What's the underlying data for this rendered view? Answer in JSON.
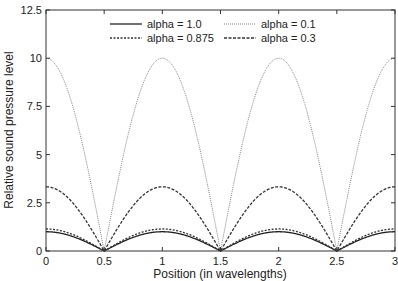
{
  "chart_data": {
    "type": "line",
    "title": "",
    "xlabel": "Position (in wavelengths)",
    "ylabel": "Relative sound pressure level",
    "xlim": [
      0,
      3
    ],
    "ylim": [
      0,
      12.5
    ],
    "xticks": [
      "0",
      "0.5",
      "1",
      "1.5",
      "2",
      "2.5",
      "3"
    ],
    "yticks": [
      "0",
      "2.5",
      "5",
      "7.5",
      "10",
      "12.5"
    ],
    "grid": false,
    "legend_position": "upper center",
    "x": [
      0,
      0.25,
      0.5,
      0.75,
      1,
      1.25,
      1.5,
      1.75,
      2,
      2.25,
      2.5,
      2.75,
      3
    ],
    "series": [
      {
        "name": "alpha = 1.0",
        "style": "solid",
        "values": [
          1.0,
          0.707,
          0,
          0.707,
          1.0,
          0.707,
          0,
          0.707,
          1.0,
          0.707,
          0,
          0.707,
          1.0
        ]
      },
      {
        "name": "alpha = 0.875",
        "style": "dotted",
        "values": [
          1.143,
          0.808,
          0,
          0.808,
          1.143,
          0.808,
          0,
          0.808,
          1.143,
          0.808,
          0,
          0.808,
          1.143
        ]
      },
      {
        "name": "alpha = 0.1",
        "style": "fine-dotted",
        "values": [
          10.0,
          7.07,
          0,
          7.07,
          10.0,
          7.07,
          0,
          7.07,
          10.0,
          7.07,
          0,
          7.07,
          10.0
        ]
      },
      {
        "name": "alpha = 0.3",
        "style": "dashed",
        "values": [
          3.33,
          2.36,
          0,
          2.36,
          3.33,
          2.36,
          0,
          2.36,
          3.33,
          2.36,
          0,
          2.36,
          3.33
        ]
      }
    ]
  }
}
